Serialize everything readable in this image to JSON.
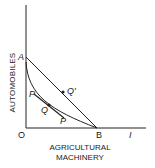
{
  "diagram": {
    "axes": {
      "y_label": "AUTOMOBILES",
      "x_label_line1": "AGRICULTURAL",
      "x_label_line2": "MACHINERY",
      "origin_label": "O"
    },
    "points": {
      "A": "A",
      "B": "B",
      "Q": "Q",
      "Q_prime": "Q'",
      "P_upper": "P",
      "P_lower": "P",
      "I": "I"
    },
    "colors": {
      "line": "#222222",
      "background": "#ffffff"
    }
  }
}
